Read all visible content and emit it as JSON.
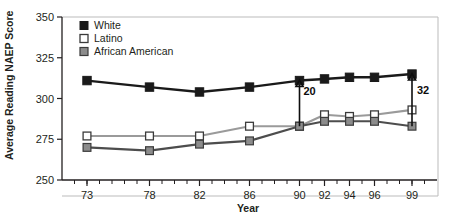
{
  "chart_data": {
    "type": "line",
    "title": "",
    "xlabel": "Year",
    "ylabel": "Average Reading NAEP Score",
    "x": [
      73,
      78,
      82,
      86,
      90,
      92,
      94,
      96,
      99
    ],
    "xtick_labels": [
      "73",
      "78",
      "82",
      "86",
      "90",
      "92",
      "94",
      "96",
      "99"
    ],
    "xlim": [
      71,
      101
    ],
    "ylim": [
      250,
      350
    ],
    "ytick_labels": [
      "250",
      "275",
      "300",
      "325",
      "350"
    ],
    "ytick_values": [
      250,
      275,
      300,
      325,
      350
    ],
    "grid": false,
    "legend_position": "top-left",
    "series": [
      {
        "name": "White",
        "marker": "filled-square",
        "color": "#1a1a1a",
        "values": [
          311,
          307,
          304,
          307,
          311,
          312,
          313,
          313,
          315
        ]
      },
      {
        "name": "Latino",
        "marker": "open-square",
        "color": "#9a9a9a",
        "values": [
          277,
          277,
          277,
          283,
          283,
          290,
          289,
          290,
          293
        ]
      },
      {
        "name": "African American",
        "marker": "gray-square",
        "color": "#8c8c8c",
        "values": [
          270,
          268,
          272,
          274,
          283,
          286,
          286,
          286,
          283
        ]
      }
    ],
    "annotations": [
      {
        "label": "20",
        "at_x": 90,
        "from_value": 283,
        "to_value": 311
      },
      {
        "label": "32",
        "at_x": 99,
        "from_value": 283,
        "to_value": 315
      }
    ]
  },
  "legend": {
    "items": [
      {
        "label": "White"
      },
      {
        "label": "Latino"
      },
      {
        "label": "African American"
      }
    ]
  }
}
